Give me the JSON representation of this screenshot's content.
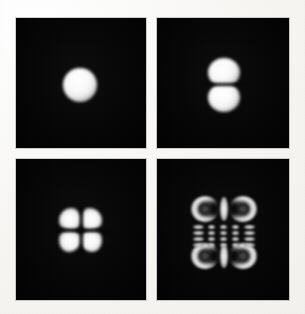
{
  "figure": {
    "title": "Transverse mode intensity patterns",
    "background_color": "#fbfbf9",
    "panel_background_color": "#050505",
    "lobe_color": "#ffffff",
    "layout": {
      "rows": 2,
      "columns": 2,
      "gutter_px": 11
    }
  },
  "panels": [
    {
      "id": "panel-00",
      "position": "top-left",
      "mode_label": "TEM00",
      "pattern": "single circular spot",
      "lobe_count": 1,
      "lobes_x": 1,
      "lobes_y": 1,
      "frame": {
        "x": 16,
        "y": 18,
        "width": 130,
        "height": 130
      },
      "features": [
        {
          "name": "central-spot",
          "cx": 64,
          "cy": 67,
          "rx": 17,
          "ry": 17
        }
      ]
    },
    {
      "id": "panel-01",
      "position": "top-right",
      "mode_label": "TEM01",
      "pattern": "two vertically stacked lobes",
      "lobe_count": 2,
      "lobes_x": 1,
      "lobes_y": 2,
      "frame": {
        "x": 157,
        "y": 18,
        "width": 132,
        "height": 130
      },
      "features": [
        {
          "name": "upper-lobe",
          "cx": 67,
          "cy": 54,
          "rx": 16,
          "ry": 14
        },
        {
          "name": "lower-lobe",
          "cx": 67,
          "cy": 79,
          "rx": 16,
          "ry": 14
        }
      ]
    },
    {
      "id": "panel-11",
      "position": "bottom-left",
      "mode_label": "TEM11",
      "pattern": "two by two array of lobes",
      "lobe_count": 4,
      "lobes_x": 2,
      "lobes_y": 2,
      "frame": {
        "x": 16,
        "y": 159,
        "width": 130,
        "height": 141
      },
      "features": [
        {
          "name": "lobe-top-left",
          "cx": 54,
          "cy": 60,
          "rx": 11,
          "ry": 11
        },
        {
          "name": "lobe-top-right",
          "cx": 74,
          "cy": 60,
          "rx": 11,
          "ry": 11
        },
        {
          "name": "lobe-bottom-left",
          "cx": 54,
          "cy": 82,
          "rx": 11,
          "ry": 11
        },
        {
          "name": "lobe-bottom-right",
          "cx": 74,
          "cy": 82,
          "rx": 11,
          "ry": 11
        }
      ]
    },
    {
      "id": "panel-hi",
      "position": "bottom-right",
      "mode_label": "high-order mode",
      "pattern": "high order multi-lobe array with corner ring lobes, central vertical bars and a grid of small dashes",
      "lobe_count": 0,
      "lobes_x": 5,
      "lobes_y": 6,
      "frame": {
        "x": 157,
        "y": 159,
        "width": 132,
        "height": 141
      },
      "features": [
        {
          "name": "arc-top-left",
          "cx": 48,
          "cy": 50,
          "rx": 14,
          "ry": 13
        },
        {
          "name": "arc-top-right",
          "cx": 86,
          "cy": 50,
          "rx": 14,
          "ry": 13
        },
        {
          "name": "bar-top-center",
          "cx": 67,
          "cy": 50,
          "rx": 4,
          "ry": 12
        },
        {
          "name": "arc-bottom-left",
          "cx": 48,
          "cy": 97,
          "rx": 14,
          "ry": 13
        },
        {
          "name": "arc-bottom-right",
          "cx": 86,
          "cy": 97,
          "rx": 14,
          "ry": 13
        },
        {
          "name": "bar-bottom-center",
          "cx": 67,
          "cy": 97,
          "rx": 4,
          "ry": 12
        },
        {
          "name": "dash-grid",
          "columns": 5,
          "rows": 4
        }
      ]
    }
  ]
}
